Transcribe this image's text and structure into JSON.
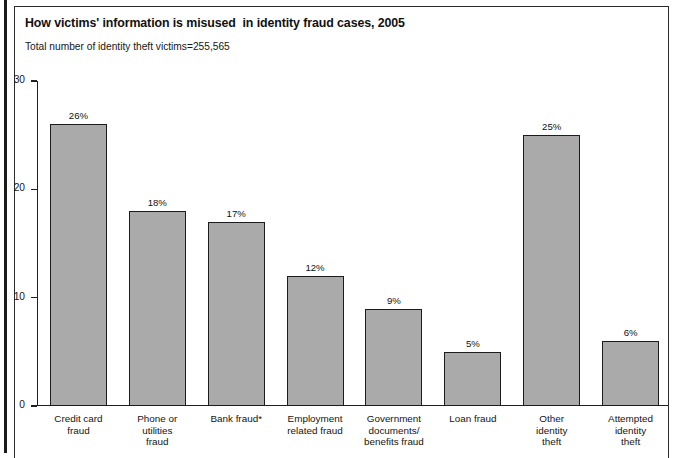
{
  "header": {
    "title": "How victims' information is misused  in identity fraud cases, 2005",
    "subtitle": "Total number of identity theft victims=255,565"
  },
  "chart_data": {
    "type": "bar",
    "title": "How victims' information is misused  in identity fraud cases, 2005",
    "subtitle": "Total number of identity theft victims=255,565",
    "xlabel": "",
    "ylabel": "",
    "ylim": [
      0,
      30
    ],
    "yticks": [
      "0",
      "10",
      "20",
      "30"
    ],
    "ytick_values": [
      0,
      10,
      20,
      30
    ],
    "grid": false,
    "legend": null,
    "categories": [
      "Credit card\nfraud",
      "Phone or\nutilities\nfraud",
      "Bank fraud*",
      "Employment\nrelated fraud",
      "Government\ndocuments/\nbenefits fraud",
      "Loan fraud",
      "Other\nidentity\ntheft",
      "Attempted\nidentity\ntheft"
    ],
    "values": [
      26,
      18,
      17,
      12,
      9,
      5,
      25,
      6
    ],
    "value_labels": [
      "26%",
      "18%",
      "17%",
      "12%",
      "9%",
      "5%",
      "25%",
      "6%"
    ],
    "bar_color": "#aaaaaa",
    "bar_edge_color": "#1c1c1c",
    "axis_color": "#1f1f1f"
  }
}
